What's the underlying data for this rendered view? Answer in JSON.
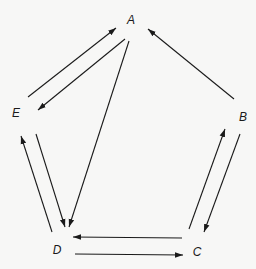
{
  "diagram": {
    "type": "directed-graph",
    "nodes": [
      {
        "id": "A",
        "label": "A",
        "x": 131,
        "y": 24
      },
      {
        "id": "B",
        "label": "B",
        "x": 243,
        "y": 121
      },
      {
        "id": "C",
        "label": "C",
        "x": 197,
        "y": 256
      },
      {
        "id": "D",
        "label": "D",
        "x": 57,
        "y": 254
      },
      {
        "id": "E",
        "label": "E",
        "x": 16,
        "y": 117
      }
    ],
    "edges": [
      {
        "from": "E",
        "to": "A",
        "x1": 28,
        "y1": 97,
        "x2": 116,
        "y2": 28
      },
      {
        "from": "A",
        "to": "E",
        "x1": 125,
        "y1": 39,
        "x2": 38,
        "y2": 110
      },
      {
        "from": "A",
        "to": "D",
        "x1": 129,
        "y1": 41,
        "x2": 69,
        "y2": 227
      },
      {
        "from": "B",
        "to": "A",
        "x1": 234,
        "y1": 99,
        "x2": 148,
        "y2": 29
      },
      {
        "from": "D",
        "to": "E",
        "x1": 52,
        "y1": 232,
        "x2": 21,
        "y2": 136
      },
      {
        "from": "E",
        "to": "D",
        "x1": 36,
        "y1": 134,
        "x2": 65,
        "y2": 227
      },
      {
        "from": "C",
        "to": "B",
        "x1": 189,
        "y1": 229,
        "x2": 225,
        "y2": 129
      },
      {
        "from": "B",
        "to": "C",
        "x1": 240,
        "y1": 134,
        "x2": 204,
        "y2": 232
      },
      {
        "from": "C",
        "to": "D",
        "x1": 182,
        "y1": 238,
        "x2": 73,
        "y2": 237
      },
      {
        "from": "D",
        "to": "C",
        "x1": 75,
        "y1": 254,
        "x2": 183,
        "y2": 255
      }
    ],
    "colors": {
      "background": "#f7f7f6",
      "stroke": "#1a1a1a"
    }
  }
}
